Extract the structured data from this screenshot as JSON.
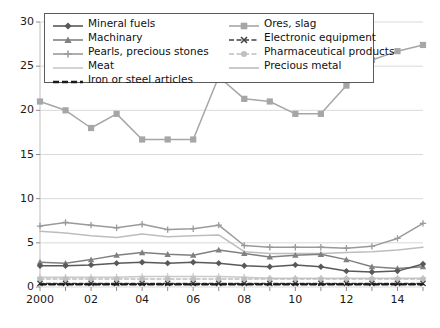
{
  "chart": {
    "type": "line",
    "title": "",
    "xlabel": "",
    "ylabel": "",
    "background": "#ffffff",
    "grid": true,
    "legend_position": "top-inside"
  },
  "axes": {
    "y": {
      "min": 0,
      "max": 30,
      "ticks": [
        0,
        5,
        10,
        15,
        20,
        25,
        30
      ],
      "tick_labels": [
        "0",
        "5",
        "10",
        "15",
        "20",
        "25",
        "30"
      ]
    },
    "x": {
      "years": [
        2000,
        2001,
        2002,
        2003,
        2004,
        2005,
        2006,
        2007,
        2008,
        2009,
        2010,
        2011,
        2012,
        2013,
        2014,
        2015
      ],
      "tick_labels": [
        "2000",
        "",
        "02",
        "",
        "04",
        "",
        "06",
        "",
        "08",
        "",
        "10",
        "",
        "12",
        "",
        "14",
        ""
      ],
      "visible_tick_labels": [
        "2000",
        "02",
        "04",
        "06",
        "08",
        "10",
        "12",
        "14"
      ]
    }
  },
  "legend": {
    "column1": [
      {
        "label": "Mineral fuels",
        "icon": "line-diamond-marker",
        "color": "#595959"
      },
      {
        "label": "Machinary",
        "icon": "line-triangle-marker",
        "color": "#808080"
      },
      {
        "label": "Pearls, precious stones",
        "icon": "line-plus-marker",
        "color": "#9a9a9a"
      },
      {
        "label": "Meat",
        "icon": "line-plain",
        "color": "#c9c9c9"
      },
      {
        "label": "Iron or steel articles",
        "icon": "line-dashed-thick",
        "color": "#1a1a1a"
      }
    ],
    "column2": [
      {
        "label": "Ores, slag",
        "icon": "line-square-marker",
        "color": "#a6a6a6"
      },
      {
        "label": "Electronic equipment",
        "icon": "line-dashed-x-marker",
        "color": "#404040"
      },
      {
        "label": "Pharmaceutical products",
        "icon": "line-dashed-circle",
        "color": "#bfbfbf"
      },
      {
        "label": "Precious metal",
        "icon": "line-plain",
        "color": "#bdbdbd"
      }
    ]
  },
  "chart_data": {
    "type": "line",
    "title": "",
    "xlabel": "",
    "ylabel": "",
    "ylim": [
      0,
      30
    ],
    "grid": true,
    "legend_position": "top-inside",
    "categories": [
      2000,
      2001,
      2002,
      2003,
      2004,
      2005,
      2006,
      2007,
      2008,
      2009,
      2010,
      2011,
      2012,
      2013,
      2014,
      2015
    ],
    "series": [
      {
        "name": "Ores, slag",
        "color": "#a6a6a6",
        "marker": "square",
        "dash": "none",
        "values": [
          21.0,
          20.0,
          18.0,
          19.6,
          16.7,
          16.7,
          16.7,
          23.8,
          21.3,
          21.0,
          19.6,
          19.6,
          22.8,
          25.7,
          26.7,
          27.4
        ]
      },
      {
        "name": "Pearls, precious stones",
        "color": "#9a9a9a",
        "marker": "plus",
        "dash": "none",
        "values": [
          6.9,
          7.3,
          7.0,
          6.7,
          7.1,
          6.5,
          6.6,
          7.0,
          4.7,
          4.5,
          4.5,
          4.5,
          4.4,
          4.6,
          5.5,
          7.2
        ]
      },
      {
        "name": "Precious metal",
        "color": "#bdbdbd",
        "marker": "none",
        "dash": "none",
        "values": [
          6.3,
          6.1,
          5.8,
          5.6,
          6.0,
          5.7,
          5.8,
          5.9,
          4.0,
          3.8,
          3.8,
          3.8,
          3.9,
          4.0,
          4.2,
          4.5
        ]
      },
      {
        "name": "Machinary",
        "color": "#808080",
        "marker": "triangle",
        "dash": "none",
        "values": [
          2.8,
          2.7,
          3.1,
          3.6,
          3.9,
          3.7,
          3.6,
          4.2,
          3.8,
          3.4,
          3.6,
          3.7,
          3.1,
          2.3,
          2.1,
          2.3
        ]
      },
      {
        "name": "Mineral fuels",
        "color": "#595959",
        "marker": "diamond",
        "dash": "none",
        "values": [
          2.4,
          2.4,
          2.5,
          2.7,
          2.8,
          2.7,
          2.8,
          2.7,
          2.4,
          2.3,
          2.5,
          2.3,
          1.8,
          1.7,
          1.8,
          2.6
        ]
      },
      {
        "name": "Meat",
        "color": "#c9c9c9",
        "marker": "plus",
        "dash": "none",
        "values": [
          1.1,
          1.1,
          1.1,
          1.1,
          1.2,
          1.2,
          1.2,
          1.2,
          1.1,
          1.0,
          1.0,
          1.0,
          1.0,
          1.0,
          1.0,
          1.0
        ]
      },
      {
        "name": "Pharmaceutical products",
        "color": "#bfbfbf",
        "marker": "circle",
        "dash": "dashed",
        "values": [
          0.9,
          0.9,
          0.9,
          0.9,
          0.9,
          0.9,
          0.9,
          0.9,
          0.9,
          0.9,
          0.9,
          0.9,
          0.9,
          0.9,
          0.9,
          0.9
        ]
      },
      {
        "name": "Electronic equipment",
        "color": "#404040",
        "marker": "x",
        "dash": "dashed",
        "values": [
          0.4,
          0.4,
          0.4,
          0.4,
          0.4,
          0.4,
          0.4,
          0.4,
          0.4,
          0.4,
          0.4,
          0.4,
          0.4,
          0.4,
          0.4,
          0.4
        ]
      },
      {
        "name": "Iron or steel articles",
        "color": "#1a1a1a",
        "marker": "none",
        "dash": "dashed-thick",
        "values": [
          0.3,
          0.3,
          0.3,
          0.3,
          0.3,
          0.3,
          0.3,
          0.3,
          0.3,
          0.3,
          0.3,
          0.3,
          0.3,
          0.3,
          0.3,
          0.3
        ]
      }
    ]
  }
}
